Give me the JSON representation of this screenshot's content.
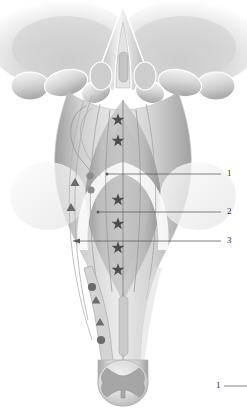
{
  "figure": {
    "background_color": "#ffffff",
    "ink_color": "#6e6e6e",
    "marker_color": "#5e5e5e",
    "leader_color": "#5a5a5a"
  },
  "labels": [
    {
      "id": "label-1",
      "text": "1",
      "x": 227,
      "y": 169
    },
    {
      "id": "label-2",
      "text": "2",
      "x": 227,
      "y": 207
    },
    {
      "id": "label-3",
      "text": "3",
      "x": 227,
      "y": 236
    },
    {
      "id": "label-1b",
      "text": "1",
      "x": 216,
      "y": 381
    }
  ],
  "leaders": [
    {
      "id": "leader-1",
      "x1": 107,
      "y1": 174,
      "x2": 221,
      "y2": 174,
      "tip": "dot"
    },
    {
      "id": "leader-2",
      "x1": 98,
      "y1": 212,
      "x2": 221,
      "y2": 212,
      "tip": "dot"
    },
    {
      "id": "leader-3",
      "x1": 73,
      "y1": 241,
      "x2": 221,
      "y2": 241,
      "tip": "arrow"
    },
    {
      "id": "leader-1b",
      "x1": 224,
      "y1": 386,
      "x2": 247,
      "y2": 386,
      "tip": "none"
    }
  ],
  "markers": {
    "stars": [
      {
        "x": 118,
        "y": 118
      },
      {
        "x": 118,
        "y": 139
      },
      {
        "x": 118,
        "y": 198
      },
      {
        "x": 118,
        "y": 222
      },
      {
        "x": 118,
        "y": 246
      },
      {
        "x": 118,
        "y": 268
      }
    ],
    "triangles": [
      {
        "x": 75,
        "y": 182
      },
      {
        "x": 71,
        "y": 207
      },
      {
        "x": 96,
        "y": 300
      },
      {
        "x": 100,
        "y": 322
      }
    ],
    "circles": [
      {
        "x": 92,
        "y": 287
      },
      {
        "x": 101,
        "y": 340
      },
      {
        "x": 90,
        "y": 176
      },
      {
        "x": 91,
        "y": 190
      }
    ]
  },
  "anatomy": {
    "cerebellum_left": "left cerebellar hemisphere",
    "cerebellum_right": "right cerebellar hemisphere",
    "midline_sulcus": "median sulcus",
    "fourth_ventricle": "rhomboid fossa",
    "peduncle_left": "left cerebellar peduncle",
    "peduncle_right": "right cerebellar peduncle",
    "medulla": "medulla oblongata",
    "spinal_cord": "spinal cord cross-section",
    "gray_matter": "butterfly-shaped gray matter"
  }
}
